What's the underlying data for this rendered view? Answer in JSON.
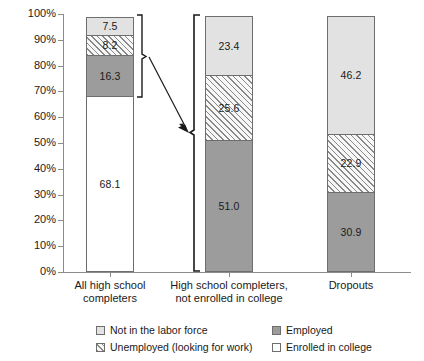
{
  "chart_data": {
    "type": "bar",
    "subtype": "stacked-100-percent",
    "title": "",
    "xlabel": "",
    "ylabel": "",
    "ylim": [
      0,
      100
    ],
    "grid": false,
    "legend_position": "bottom",
    "categories": [
      "All high school completers",
      "High school completers, not enrolled in college",
      "Dropouts"
    ],
    "series": [
      {
        "name": "Enrolled in college",
        "values": [
          68.1,
          null,
          null
        ]
      },
      {
        "name": "Employed",
        "values": [
          16.3,
          51.0,
          30.9
        ]
      },
      {
        "name": "Unemployed (looking for work)",
        "values": [
          8.2,
          25.6,
          22.9
        ]
      },
      {
        "name": "Not in the labor force",
        "values": [
          7.5,
          23.4,
          46.2
        ]
      }
    ],
    "y_ticks": [
      "0%",
      "10%",
      "20%",
      "30%",
      "40%",
      "50%",
      "60%",
      "70%",
      "80%",
      "90%",
      "100%"
    ]
  },
  "axis": {
    "y_ticks": [
      {
        "label": "100%",
        "value": 100
      },
      {
        "label": "90%",
        "value": 90
      },
      {
        "label": "80%",
        "value": 80
      },
      {
        "label": "70%",
        "value": 70
      },
      {
        "label": "60%",
        "value": 60
      },
      {
        "label": "50%",
        "value": 50
      },
      {
        "label": "40%",
        "value": 40
      },
      {
        "label": "30%",
        "value": 30
      },
      {
        "label": "20%",
        "value": 20
      },
      {
        "label": "10%",
        "value": 10
      },
      {
        "label": "0%",
        "value": 0
      }
    ]
  },
  "bars": [
    {
      "id": "all-high-school-completers",
      "category_line1": "All high school",
      "category_line2": "completers",
      "segments": [
        {
          "series": "Not in the labor force",
          "value": 7.5,
          "label": "7.5",
          "fill": "light"
        },
        {
          "series": "Unemployed (looking for work)",
          "value": 8.2,
          "label": "8.2",
          "fill": "hatch"
        },
        {
          "series": "Employed",
          "value": 16.3,
          "label": "16.3",
          "fill": "dark"
        },
        {
          "series": "Enrolled in college",
          "value": 68.1,
          "label": "68.1",
          "fill": "white"
        }
      ]
    },
    {
      "id": "completers-not-enrolled",
      "category_line1": "High school completers,",
      "category_line2": "not enrolled in college",
      "segments": [
        {
          "series": "Not in the labor force",
          "value": 23.4,
          "label": "23.4",
          "fill": "light"
        },
        {
          "series": "Unemployed (looking for work)",
          "value": 25.6,
          "label": "25.6",
          "fill": "hatch"
        },
        {
          "series": "Employed",
          "value": 51.0,
          "label": "51.0",
          "fill": "dark"
        }
      ]
    },
    {
      "id": "dropouts",
      "category_line1": "Dropouts",
      "category_line2": "",
      "segments": [
        {
          "series": "Not in the labor force",
          "value": 46.2,
          "label": "46.2",
          "fill": "light"
        },
        {
          "series": "Unemployed (looking for work)",
          "value": 22.9,
          "label": "22.9",
          "fill": "hatch"
        },
        {
          "series": "Employed",
          "value": 30.9,
          "label": "30.9",
          "fill": "dark"
        }
      ]
    }
  ],
  "legend": {
    "items": [
      {
        "label": "Not in the labor force",
        "fill": "light"
      },
      {
        "label": "Employed",
        "fill": "dark"
      },
      {
        "label": "Unemployed (looking for work)",
        "fill": "hatch"
      },
      {
        "label": "Enrolled in college",
        "fill": "white"
      }
    ]
  },
  "annotations": {
    "bracket_source": "bracket spanning non-college segments of first bar",
    "bracket_target": "bracket spanning full second bar",
    "arrow": "arrow from first bar bracket to second bar bracket"
  },
  "colors": {
    "light": "#e2e2e2",
    "dark": "#9c9c9c",
    "white": "#ffffff",
    "hatch": "#f4f4f4",
    "outline": "#6e6e6e",
    "axis": "#8c8c8c",
    "text": "#1a1a1a"
  }
}
